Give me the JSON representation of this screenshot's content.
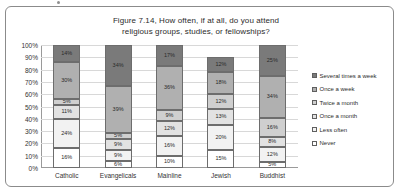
{
  "figure": {
    "title_line1": "Figure 7.14, How often, if at all, do you attend",
    "title_line2": "religious groups, studies, or fellowships?"
  },
  "chart_data": {
    "type": "bar",
    "subtype": "stacked-100",
    "title": "Figure 7.14, How often, if at all, do you attend religious groups, studies, or fellowships?",
    "xlabel": "",
    "ylabel": "",
    "ylim": [
      0,
      100
    ],
    "grid": true,
    "legend_position": "right",
    "categories": [
      "Catholic",
      "Evangelicals",
      "Mainline",
      "Jewish",
      "Buddhist"
    ],
    "ytick_labels": [
      "0%",
      "10%",
      "20%",
      "30%",
      "40%",
      "50%",
      "60%",
      "70%",
      "80%",
      "90%",
      "100%"
    ],
    "ytick_values": [
      0,
      10,
      20,
      30,
      40,
      50,
      60,
      70,
      80,
      90,
      100
    ],
    "series": [
      {
        "name": "Never",
        "color": "#ffffff",
        "values": [
          16,
          6,
          10,
          15,
          5
        ],
        "labels": [
          "16%",
          "6%",
          "10%",
          "15%",
          "5%"
        ]
      },
      {
        "name": "Less often",
        "color": "#f2f2f2",
        "values": [
          24,
          9,
          16,
          20,
          12
        ],
        "labels": [
          "24%",
          "9%",
          "16%",
          "20%",
          "12%"
        ]
      },
      {
        "name": "Once a month",
        "color": "#e2e2e2",
        "values": [
          11,
          9,
          12,
          13,
          8
        ],
        "labels": [
          "11%",
          "9%",
          "12%",
          "13%",
          "8%"
        ]
      },
      {
        "name": "Twice a month",
        "color": "#cfcfcf",
        "values": [
          5,
          5,
          9,
          12,
          16
        ],
        "labels": [
          "5%",
          "5%",
          "9%",
          "12%",
          "16%"
        ]
      },
      {
        "name": "Once a week",
        "color": "#b0b0b0",
        "values": [
          30,
          39,
          36,
          18,
          34
        ],
        "labels": [
          "30%",
          "39%",
          "36%",
          "18%",
          "34%"
        ]
      },
      {
        "name": "Several times a week",
        "color": "#7a7a7a",
        "values": [
          14,
          34,
          17,
          12,
          25
        ],
        "labels": [
          "14%",
          "34%",
          "17%",
          "12%",
          "25%"
        ]
      }
    ],
    "legend_entries": [
      "Several times a week",
      "Once a week",
      "Twice a month",
      "Once a month",
      "Less often",
      "Never"
    ]
  }
}
